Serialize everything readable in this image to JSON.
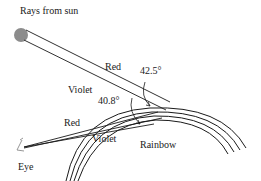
{
  "labels": {
    "rays_from_sun": "Rays from sun",
    "red_top": "Red",
    "violet_top": "Violet",
    "angle_red": "42.5°",
    "angle_violet": "40.8°",
    "red_bottom": "Red",
    "violet_bottom": "Violet",
    "rainbow": "Rainbow",
    "eye": "Eye"
  },
  "colors": {
    "line": "#1a1a1a",
    "sun_fill": "#8c8c8c",
    "eye": "#8a8a8a"
  }
}
